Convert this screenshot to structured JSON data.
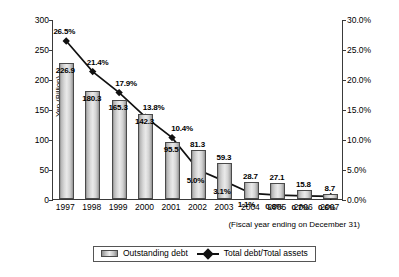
{
  "chart_data": {
    "type": "bar",
    "title": "",
    "subtitle": "",
    "xlabel": "(Fiscal year ending on December 31)",
    "ylabel": "Yen (Billion)",
    "ylabel_right": "",
    "categories": [
      "1997",
      "1998",
      "1999",
      "2000",
      "2001",
      "2002",
      "2003",
      "2004",
      "2005",
      "2006",
      "2007"
    ],
    "ylim": [
      0,
      300
    ],
    "yticks": [
      "0",
      "50",
      "100",
      "150",
      "200",
      "250",
      "300"
    ],
    "ylim_right": [
      0,
      30
    ],
    "yticks_right": [
      "0.0%",
      "5.0%",
      "10.0%",
      "15.0%",
      "20.0%",
      "25.0%",
      "30.0%"
    ],
    "grid": false,
    "legend_position": "bottom",
    "series": [
      {
        "name": "Outstanding debt",
        "type": "bar",
        "axis": "left",
        "unit": "Yen (Billion)",
        "values": [
          226.9,
          180.3,
          165.3,
          142.3,
          95.5,
          81.3,
          59.3,
          28.7,
          27.1,
          15.8,
          8.7
        ],
        "labels": [
          "226.9",
          "180.3",
          "165.3",
          "142.3",
          "95.5",
          "81.3",
          "59.3",
          "28.7",
          "27.1",
          "15.8",
          "8.7"
        ]
      },
      {
        "name": "Total debt/Total assets",
        "type": "line",
        "axis": "right",
        "unit": "%",
        "values": [
          26.5,
          21.4,
          17.9,
          13.8,
          10.4,
          5.0,
          3.1,
          1.1,
          0.8,
          0.7,
          0.6
        ],
        "labels": [
          "26.5%",
          "21.4%",
          "17.9%",
          "13.8%",
          "10.4%",
          "5.0%",
          "3.1%",
          "1.1%",
          "0.8%",
          "0.7%",
          "0.6%"
        ]
      }
    ]
  },
  "legend": {
    "items": [
      {
        "label": "Outstanding debt",
        "marker": "bar-swatch"
      },
      {
        "label": "Total debt/Total assets",
        "marker": "line-diamond-marker"
      }
    ]
  }
}
